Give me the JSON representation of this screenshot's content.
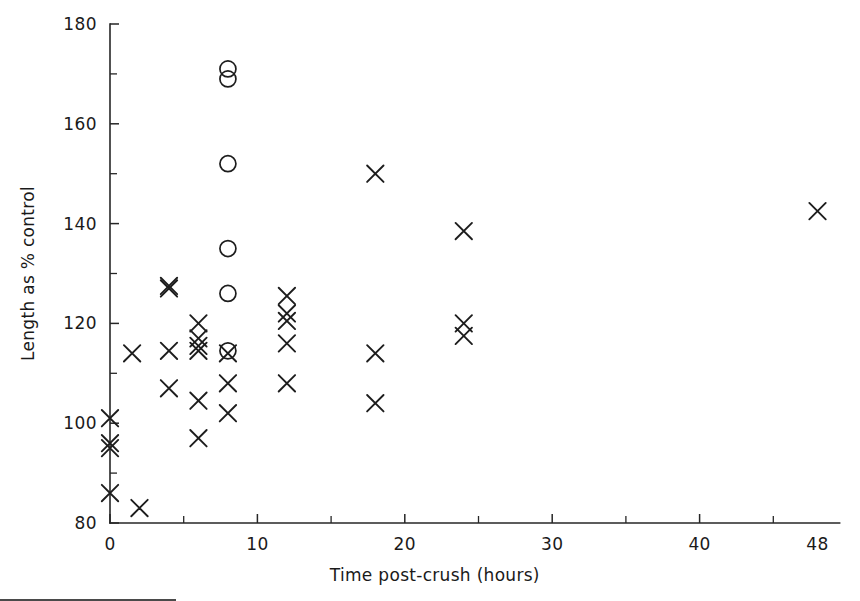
{
  "chart_data": {
    "type": "scatter",
    "title": "",
    "subtitle": "",
    "xlabel": "Time post-crush (hours)",
    "ylabel": "Length as % control",
    "xlim": [
      0,
      49.5
    ],
    "ylim": [
      80,
      180
    ],
    "grid": false,
    "legend_position": "none",
    "x_ticks_major": [
      0,
      10,
      20,
      30,
      40,
      48
    ],
    "x_ticklabels": [
      "0",
      "10",
      "20",
      "30",
      "40",
      "48"
    ],
    "x_ticks_minor": [
      5,
      15,
      25,
      35,
      45
    ],
    "y_ticks_major": [
      80,
      100,
      120,
      140,
      160,
      180
    ],
    "y_ticklabels": [
      "80",
      "100",
      "120",
      "140",
      "160",
      "180"
    ],
    "y_ticks_minor": [
      90,
      110,
      130,
      150,
      170
    ],
    "series": [
      {
        "name": "cross-marker-series",
        "marker": "x",
        "color": "#1d1d1d",
        "points": [
          {
            "x": 0,
            "y": 101
          },
          {
            "x": 0,
            "y": 96
          },
          {
            "x": 0,
            "y": 95
          },
          {
            "x": 0,
            "y": 86
          },
          {
            "x": 2,
            "y": 83
          },
          {
            "x": 1.5,
            "y": 114
          },
          {
            "x": 4,
            "y": 127.5
          },
          {
            "x": 4,
            "y": 127
          },
          {
            "x": 4,
            "y": 114.5
          },
          {
            "x": 4,
            "y": 107
          },
          {
            "x": 6,
            "y": 120
          },
          {
            "x": 6,
            "y": 117
          },
          {
            "x": 6,
            "y": 115.5
          },
          {
            "x": 6,
            "y": 114.5
          },
          {
            "x": 6,
            "y": 104.5
          },
          {
            "x": 6,
            "y": 97
          },
          {
            "x": 8,
            "y": 114
          },
          {
            "x": 8,
            "y": 108
          },
          {
            "x": 8,
            "y": 102
          },
          {
            "x": 12,
            "y": 125.5
          },
          {
            "x": 12,
            "y": 122
          },
          {
            "x": 12,
            "y": 120.5
          },
          {
            "x": 12,
            "y": 116
          },
          {
            "x": 12,
            "y": 108
          },
          {
            "x": 18,
            "y": 150
          },
          {
            "x": 18,
            "y": 114
          },
          {
            "x": 18,
            "y": 104
          },
          {
            "x": 24,
            "y": 138.5
          },
          {
            "x": 24,
            "y": 120
          },
          {
            "x": 24,
            "y": 117.5
          },
          {
            "x": 48,
            "y": 142.5
          }
        ]
      },
      {
        "name": "circle-marker-series",
        "marker": "o",
        "color": "#1d1d1d",
        "points": [
          {
            "x": 8,
            "y": 171
          },
          {
            "x": 8,
            "y": 169
          },
          {
            "x": 8,
            "y": 152
          },
          {
            "x": 8,
            "y": 135
          },
          {
            "x": 8,
            "y": 126
          },
          {
            "x": 8,
            "y": 114.5
          }
        ]
      }
    ]
  },
  "axes": {
    "y_axis_title": "Length as % control",
    "x_axis_title": "Time post-crush (hours)"
  },
  "colors": {
    "marker": "#1d1d1d",
    "axis": "#262626",
    "background": "#ffffff",
    "rule": "#4a4a4a"
  }
}
